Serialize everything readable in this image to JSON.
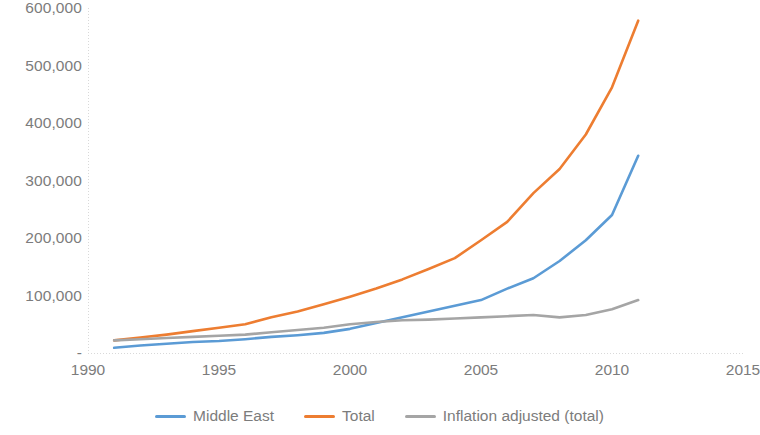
{
  "chart_data": {
    "type": "line",
    "title": "",
    "subtitle": "",
    "xlabel": "",
    "ylabel": "",
    "xlim": [
      1990,
      2015
    ],
    "ylim": [
      0,
      600000
    ],
    "grid": false,
    "legend_position": "bottom",
    "x_tick_labels": [
      "1990",
      "1995",
      "2000",
      "2005",
      "2010",
      "2015"
    ],
    "x_tick_values": [
      1990,
      1995,
      2000,
      2005,
      2010,
      2015
    ],
    "y_tick_labels": [
      "-",
      "100,000",
      "200,000",
      "300,000",
      "400,000",
      "500,000",
      "600,000"
    ],
    "y_tick_values": [
      0,
      100000,
      200000,
      300000,
      400000,
      500000,
      600000
    ],
    "x": [
      1991,
      1992,
      1993,
      1994,
      1995,
      1996,
      1997,
      1998,
      1999,
      2000,
      2001,
      2002,
      2003,
      2004,
      2005,
      2006,
      2007,
      2008,
      2009,
      2010,
      2011
    ],
    "series": [
      {
        "name": "Middle East",
        "color": "#5B9BD5",
        "values": [
          9000,
          13000,
          16000,
          19000,
          21000,
          24000,
          28000,
          31000,
          35000,
          42000,
          52000,
          62000,
          72000,
          82000,
          92000,
          112000,
          130000,
          160000,
          196000,
          240000,
          343000
        ]
      },
      {
        "name": "Total",
        "color": "#ED7D31",
        "values": [
          22000,
          27000,
          32000,
          38000,
          44000,
          50000,
          62000,
          72000,
          85000,
          98000,
          112000,
          128000,
          146000,
          165000,
          196000,
          228000,
          278000,
          320000,
          380000,
          462000,
          578000
        ]
      },
      {
        "name": "Inflation adjusted (total)",
        "color": "#A5A5A5",
        "values": [
          22000,
          24000,
          26000,
          28000,
          30000,
          32000,
          36000,
          40000,
          44000,
          50000,
          54000,
          57000,
          58000,
          60000,
          62000,
          64000,
          66000,
          62000,
          66000,
          76000,
          92000
        ]
      }
    ]
  },
  "legend": {
    "items": [
      {
        "label": "Middle East",
        "color": "#5B9BD5"
      },
      {
        "label": "Total",
        "color": "#ED7D31"
      },
      {
        "label": "Inflation adjusted (total)",
        "color": "#A5A5A5"
      }
    ]
  },
  "colors": {
    "middle_east": "#5B9BD5",
    "total": "#ED7D31",
    "inflation_adjusted": "#A5A5A5",
    "axis": "#D9D9D9",
    "tick_text": "#7C7C7C",
    "background": "#FFFFFF"
  }
}
